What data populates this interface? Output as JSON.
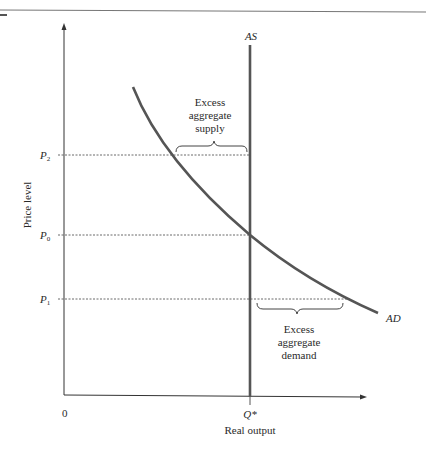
{
  "diagram": {
    "type": "aggregate-supply-demand",
    "axes": {
      "y_label": "Price level",
      "x_label": "Real output",
      "origin_label": "0"
    },
    "price_levels": [
      {
        "id": "P2",
        "base": "P",
        "sub": "2",
        "y": 155
      },
      {
        "id": "P0",
        "base": "P",
        "sub": "0",
        "y": 235
      },
      {
        "id": "P1",
        "base": "P",
        "sub": "1",
        "y": 299
      }
    ],
    "curves": {
      "as_label": "AS",
      "ad_label": "AD"
    },
    "output_marker": "Q*",
    "annotations": {
      "excess_supply": [
        "Excess",
        "aggregate",
        "supply"
      ],
      "excess_demand": [
        "Excess",
        "aggregate",
        "demand"
      ]
    },
    "colors": {
      "curve": "#555555",
      "axis": "#333333",
      "text": "#2a2a2a"
    }
  }
}
